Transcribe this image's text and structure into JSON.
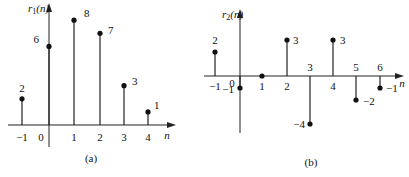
{
  "chart_data": [
    {
      "type": "stem",
      "id": "a",
      "caption": "(a)",
      "ylabel": "r1(n)",
      "ylabel_main": "r",
      "ylabel_sub": "1",
      "ylabel_arg": "(n)",
      "xlabel": "n",
      "x": [
        -1,
        0,
        1,
        2,
        3,
        4
      ],
      "values": [
        2,
        6,
        8,
        7,
        3,
        1
      ],
      "tick_labels": [
        "−1",
        "0",
        "1",
        "2",
        "3",
        "4"
      ],
      "value_labels": [
        "2",
        "6",
        "8",
        "7",
        "3",
        "1"
      ]
    },
    {
      "type": "stem",
      "id": "b",
      "caption": "(b)",
      "ylabel": "r2(n)",
      "ylabel_main": "r",
      "ylabel_sub": "2",
      "ylabel_arg": "(n)",
      "xlabel": "n",
      "x": [
        -1,
        0,
        1,
        2,
        3,
        4,
        5,
        6
      ],
      "values": [
        2,
        -1,
        0,
        3,
        -4,
        3,
        -2,
        -1
      ],
      "tick_labels": [
        "−1",
        "0",
        "1",
        "2",
        "3",
        "4",
        "5",
        "6"
      ],
      "value_labels": [
        "2",
        "−1",
        "",
        "3",
        "−4",
        "3",
        "−2",
        "−1"
      ]
    }
  ]
}
